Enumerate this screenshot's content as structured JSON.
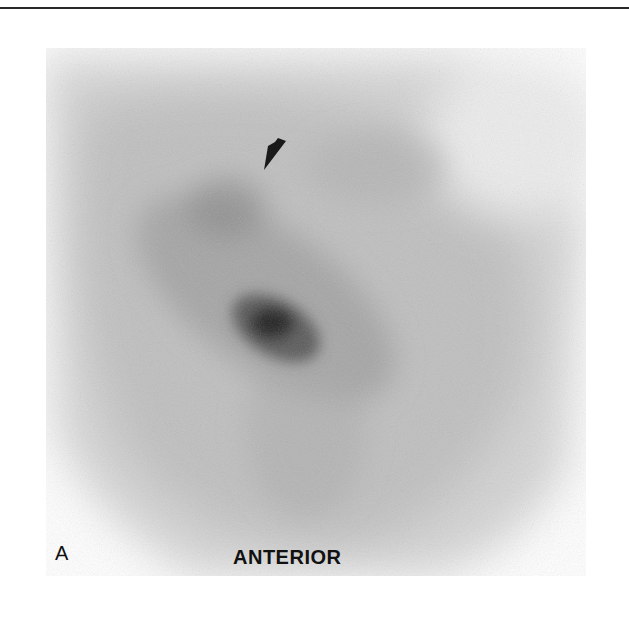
{
  "figure": {
    "panel_label": "A",
    "view_label": "ANTERIOR",
    "annotation": {
      "type": "arrowhead",
      "icon": "arrowhead-icon",
      "points_to": "focal uptake superior region",
      "tip": [
        264,
        170
      ],
      "tail": [
        276,
        138
      ]
    },
    "colors": {
      "background": "#ffffff",
      "scan_light": "#e6e6e6",
      "scan_mid": "#a8a8a8",
      "scan_dark": "#2a2a2a",
      "label": "#111111",
      "rule": "#2a2a2a"
    }
  }
}
